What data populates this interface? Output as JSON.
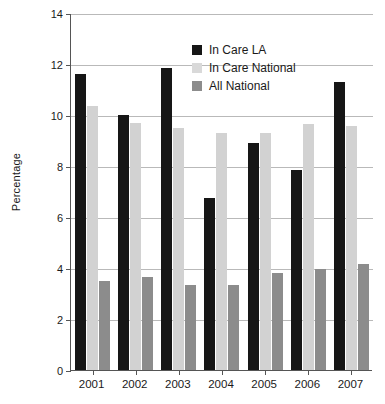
{
  "chart_data": {
    "type": "bar",
    "title": "",
    "xlabel": "",
    "ylabel": "Percentage",
    "categories": [
      "2001",
      "2002",
      "2003",
      "2004",
      "2005",
      "2006",
      "2007"
    ],
    "ylim": [
      0,
      14
    ],
    "yticks": [
      0,
      2,
      4,
      6,
      8,
      10,
      12,
      14
    ],
    "ytick_labels": [
      "0",
      "2",
      "4",
      "6",
      "8",
      "10",
      "12",
      "14"
    ],
    "grid": true,
    "legend_position": "upper-center",
    "series": [
      {
        "name": "In Care LA",
        "color": "#161616",
        "values": [
          11.6,
          10.0,
          11.85,
          6.75,
          8.9,
          7.85,
          11.3
        ]
      },
      {
        "name": "In Care National",
        "color": "#d9d9d9",
        "values": [
          10.35,
          9.7,
          9.5,
          9.3,
          9.3,
          9.65,
          9.55
        ]
      },
      {
        "name": "All National",
        "color": "#8c8c8c",
        "values": [
          3.5,
          3.65,
          3.35,
          3.35,
          3.8,
          3.95,
          4.15
        ]
      }
    ]
  }
}
